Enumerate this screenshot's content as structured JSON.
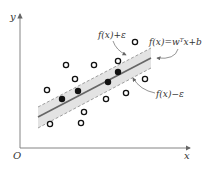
{
  "diagram": {
    "axes": {
      "origin_label": "O",
      "x_label": "x",
      "y_label": "y"
    },
    "labels": {
      "upper": "f(x)+ε",
      "center": "f(x)=wᵀx+b",
      "lower": "f(x)−ε"
    },
    "colors": {
      "band_fill": "#e3e3e3",
      "center_line": "#666666",
      "dashed_line": "#888888",
      "point": "#111111",
      "axis": "#777777"
    },
    "open_points": [
      {
        "x": 66,
        "y": 65
      },
      {
        "x": 94,
        "y": 65
      },
      {
        "x": 75,
        "y": 79
      },
      {
        "x": 47,
        "y": 90
      },
      {
        "x": 118,
        "y": 61
      },
      {
        "x": 135,
        "y": 42
      },
      {
        "x": 145,
        "y": 79
      },
      {
        "x": 106,
        "y": 99
      },
      {
        "x": 126,
        "y": 93
      },
      {
        "x": 84,
        "y": 112
      },
      {
        "x": 50,
        "y": 124
      },
      {
        "x": 81,
        "y": 123
      }
    ],
    "filled_points": [
      {
        "x": 62,
        "y": 99
      },
      {
        "x": 78,
        "y": 91
      },
      {
        "x": 108,
        "y": 82
      },
      {
        "x": 118,
        "y": 72
      }
    ]
  }
}
